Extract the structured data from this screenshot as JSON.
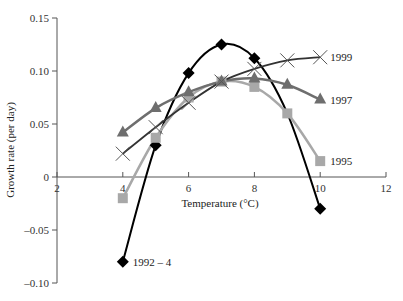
{
  "chart_data": {
    "type": "line",
    "title": "",
    "xlabel": "Temperature (°C)",
    "ylabel": "Growth rate (per day)",
    "xlim": [
      2,
      12
    ],
    "ylim": [
      -0.1,
      0.15
    ],
    "xticks": [
      "2",
      "4",
      "6",
      "8",
      "10",
      "12"
    ],
    "yticks": [
      "0.15",
      "0.10",
      "0.05",
      "0",
      "-0.05",
      "-0.10"
    ],
    "grid": false,
    "legend_position": "inline labels at line ends",
    "series": [
      {
        "name": "1992 – 4",
        "marker": "diamond",
        "color": "#000000",
        "x": [
          4,
          5,
          6,
          7,
          8,
          10
        ],
        "y": [
          -0.08,
          0.03,
          0.098,
          0.125,
          0.112,
          -0.03
        ]
      },
      {
        "name": "1995",
        "marker": "square",
        "color": "#a8a8a8",
        "x": [
          4,
          5,
          6,
          7,
          8,
          9,
          10
        ],
        "y": [
          -0.02,
          0.037,
          0.075,
          0.09,
          0.085,
          0.06,
          0.015
        ]
      },
      {
        "name": "1997",
        "marker": "triangle",
        "color": "#6e6e6e",
        "x": [
          4,
          5,
          6,
          7,
          8,
          9,
          10
        ],
        "y": [
          0.042,
          0.065,
          0.08,
          0.09,
          0.093,
          0.087,
          0.073
        ]
      },
      {
        "name": "1999",
        "marker": "x",
        "color": "#333333",
        "x": [
          4,
          5,
          6,
          7,
          8,
          9,
          10
        ],
        "y": [
          0.022,
          0.047,
          0.07,
          0.09,
          0.102,
          0.11,
          0.113
        ]
      }
    ]
  }
}
